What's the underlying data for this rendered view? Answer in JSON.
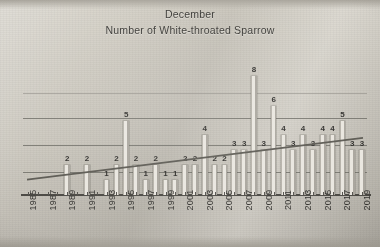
{
  "titles": {
    "line1": "December",
    "line2": "Number of White-throated Sparrow"
  },
  "chart_data": {
    "type": "bar",
    "subtitle": "Number of White-throated Sparrow",
    "xlabel": "",
    "ylabel": "",
    "ylim": [
      0,
      9
    ],
    "grid": true,
    "gridlines": [
      2,
      4,
      6,
      8
    ],
    "legend": "none",
    "label_interval_years": 2,
    "categories": [
      "1985",
      "1986",
      "1987",
      "1988",
      "1989",
      "1990",
      "1991",
      "1992",
      "1993",
      "1994",
      "1995",
      "1996",
      "1997",
      "1998",
      "1999",
      "2000",
      "2001",
      "2002",
      "2003",
      "2004",
      "2005",
      "2006",
      "2007",
      "2008",
      "2009",
      "2010",
      "2011",
      "2012",
      "2013",
      "2014",
      "2015",
      "2016",
      "2017",
      "2018",
      "2019"
    ],
    "tick_labels": [
      "1985",
      "",
      "1987",
      "",
      "1989",
      "",
      "1991",
      "",
      "1993",
      "",
      "1995",
      "",
      "1997",
      "",
      "1999",
      "",
      "2001",
      "",
      "2003",
      "",
      "2005",
      "",
      "2007",
      "",
      "2009",
      "",
      "2011",
      "",
      "2013",
      "",
      "2015",
      "",
      "2017",
      "",
      "2019"
    ],
    "values": [
      0,
      0,
      0,
      0,
      2,
      0,
      2,
      0,
      1,
      2,
      5,
      2,
      1,
      2,
      1,
      1,
      2,
      2,
      4,
      2,
      2,
      3,
      3,
      8,
      3,
      6,
      4,
      3,
      4,
      3,
      4,
      4,
      5,
      3,
      3
    ],
    "bar_labels": [
      "",
      "",
      "",
      "",
      "2",
      "",
      "2",
      "",
      "1",
      "2",
      "5",
      "2",
      "1",
      "2",
      "1",
      "1",
      "2",
      "2",
      "4",
      "2",
      "2",
      "3",
      "3",
      "8",
      "3",
      "6",
      "4",
      "3",
      "4",
      "3",
      "4",
      "4",
      "5",
      "3",
      "3"
    ],
    "trendline": {
      "type": "linear",
      "start_value": 1.1,
      "end_value": 3.9
    }
  },
  "colors": {
    "bar_face": "#e9e6df",
    "bar_edge": "#a9a59d",
    "gridline": "#6f6d66",
    "axis": "#4a4843",
    "trendline": "#5b5952",
    "text": "#33322f",
    "background": "#cdc9bf"
  }
}
